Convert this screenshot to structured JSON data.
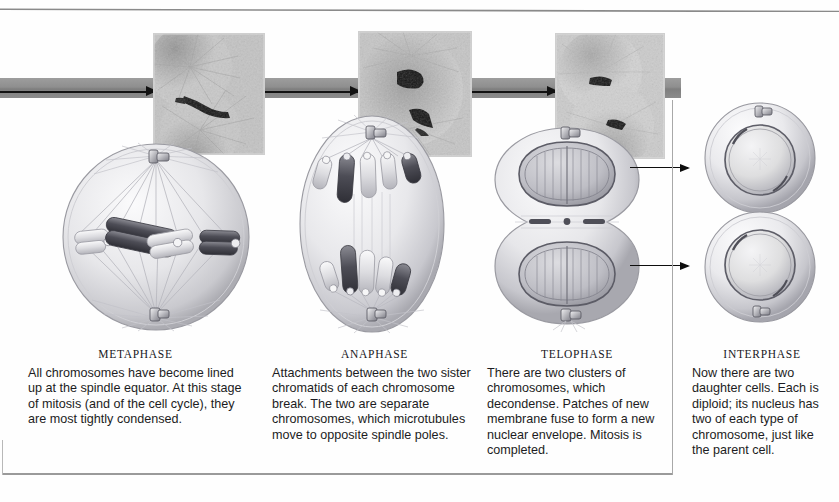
{
  "figure": {
    "panels": [
      {
        "id": "metaphase",
        "heading": "METAPHASE",
        "body": "All chromosomes have become lined up at the spindle equator. At this stage of mitosis (and of the cell cycle), they are most tightly condensed.",
        "micrograph_alt": "light micrograph of cell at metaphase",
        "illustration_alt": "round cell with spindle and chromosomes aligned at equator"
      },
      {
        "id": "anaphase",
        "heading": "ANAPHASE",
        "body": "Attachments between the two sister chromatids of each chromosome break. The two are separate chromosomes, which microtubules move to opposite spindle poles.",
        "micrograph_alt": "light micrograph of cell at anaphase",
        "illustration_alt": "elongated cell with two chromosome sets moving to poles"
      },
      {
        "id": "telophase",
        "heading": "TELOPHASE",
        "body": "There are two clusters of chromosomes, which decondense. Patches of new membrane fuse to form a new nuclear envelope. Mitosis is completed.",
        "micrograph_alt": "light micrograph of cell at telophase",
        "illustration_alt": "dumbbell shaped cell with two reforming nuclei"
      },
      {
        "id": "interphase",
        "heading": "INTERPHASE",
        "body": "Now there are two daughter cells. Each is diploid; its nucleus has two of each type of chromosome, just like the parent cell.",
        "micrograph_alt": "",
        "illustration_alt": "two round daughter cells each with a nucleus"
      }
    ],
    "colors": {
      "band_gray": "#8f8f8f",
      "arrow_black": "#121212",
      "rule_gray": "#8a8a8a",
      "frame_gray": "#a8a8a8",
      "text": "#1c1c22",
      "chromosome_dark": "#4a4a52",
      "chromosome_light": "#d4d4d8",
      "cell_fill": "#e9e9ec"
    }
  }
}
